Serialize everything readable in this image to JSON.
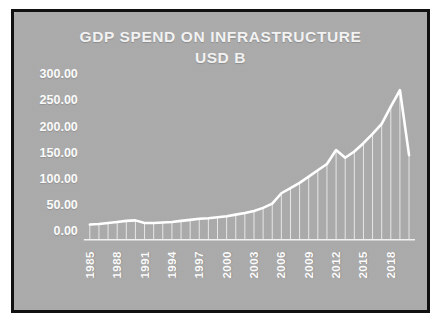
{
  "chart_data": {
    "type": "area",
    "title": "GDP SPEND ON INFRASTRUCTURE",
    "subtitle": "USD B",
    "xlabel": "",
    "ylabel": "",
    "ylim": [
      0,
      300
    ],
    "ytick_labels": [
      "300.00",
      "250.00",
      "200.00",
      "150.00",
      "100.00",
      "50.00",
      "0.00"
    ],
    "ytick_values": [
      300,
      250,
      200,
      150,
      100,
      50,
      0
    ],
    "xtick_labels": [
      "1985",
      "1988",
      "1991",
      "1994",
      "1997",
      "2000",
      "2003",
      "2006",
      "2009",
      "2012",
      "2015",
      "2018"
    ],
    "grid": false,
    "legend": null,
    "series_color": "#ffffff",
    "background_color": "#b2b2b2",
    "border_color": "#111111",
    "x": [
      1985,
      1986,
      1987,
      1988,
      1989,
      1990,
      1991,
      1992,
      1993,
      1994,
      1995,
      1996,
      1997,
      1998,
      1999,
      2000,
      2001,
      2002,
      2003,
      2004,
      2005,
      2006,
      2007,
      2008,
      2009,
      2010,
      2011,
      2012,
      2013,
      2014,
      2015,
      2016,
      2017,
      2018,
      2019,
      2020
    ],
    "values": [
      12,
      13,
      15,
      17,
      19,
      20,
      15,
      15,
      16,
      17,
      19,
      21,
      23,
      24,
      26,
      28,
      31,
      34,
      38,
      44,
      52,
      72,
      82,
      92,
      104,
      116,
      128,
      155,
      140,
      152,
      168,
      186,
      205,
      238,
      270,
      145
    ]
  }
}
